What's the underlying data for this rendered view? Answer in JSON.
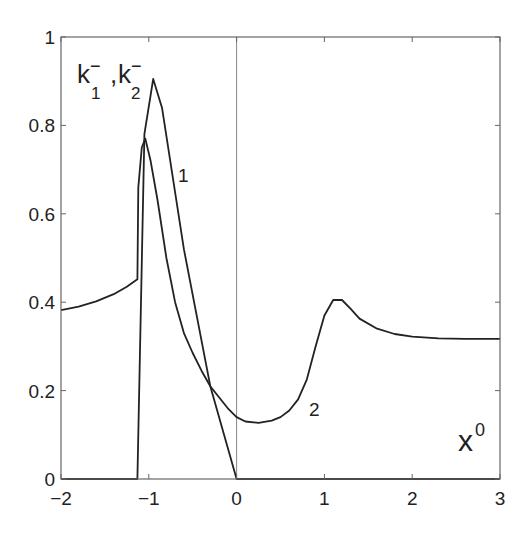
{
  "chart_data": {
    "type": "line",
    "title": "",
    "xlabel": "x^0",
    "ylabel": "k1-, k2-",
    "xlim": [
      -2,
      3
    ],
    "ylim": [
      0,
      1
    ],
    "xticks": [
      -2,
      -1,
      0,
      1,
      2,
      3
    ],
    "yticks": [
      0,
      0.2,
      0.4,
      0.6,
      0.8,
      1
    ],
    "xtick_labels": [
      "−2",
      "−1",
      "0",
      "1",
      "2",
      "3"
    ],
    "ytick_labels": [
      "0",
      "0.2",
      "0.4",
      "0.6",
      "0.8",
      "1"
    ],
    "grid": false,
    "legend": "none (inline curve labels)",
    "reference_lines": [
      {
        "orientation": "vertical",
        "x": 0
      }
    ],
    "series": [
      {
        "name": "1",
        "x": [
          -2,
          -1.13,
          -1.13,
          -1.05,
          -0.95,
          -0.85,
          -0.6,
          -0.3,
          0,
          0.0001,
          3
        ],
        "y": [
          0,
          0,
          0,
          0.78,
          0.905,
          0.84,
          0.52,
          0.21,
          0,
          0,
          0
        ]
      },
      {
        "name": "2",
        "x": [
          -2,
          -1.8,
          -1.6,
          -1.4,
          -1.25,
          -1.13,
          -1.12,
          -1.08,
          -1.04,
          -0.98,
          -0.9,
          -0.8,
          -0.7,
          -0.6,
          -0.5,
          -0.4,
          -0.3,
          -0.2,
          -0.1,
          0,
          0.1,
          0.25,
          0.4,
          0.5,
          0.6,
          0.7,
          0.8,
          0.9,
          1.0,
          1.1,
          1.2,
          1.3,
          1.4,
          1.6,
          1.8,
          2.0,
          2.3,
          2.6,
          3.0
        ],
        "y": [
          0.382,
          0.39,
          0.402,
          0.418,
          0.435,
          0.452,
          0.66,
          0.75,
          0.77,
          0.72,
          0.63,
          0.5,
          0.4,
          0.33,
          0.285,
          0.245,
          0.21,
          0.185,
          0.16,
          0.14,
          0.13,
          0.127,
          0.132,
          0.14,
          0.155,
          0.18,
          0.225,
          0.3,
          0.37,
          0.405,
          0.405,
          0.385,
          0.363,
          0.34,
          0.328,
          0.322,
          0.318,
          0.317,
          0.317
        ]
      }
    ],
    "annotations": [
      {
        "text": "1",
        "x": -0.8,
        "y": 0.73
      },
      {
        "text": "2",
        "x": 0.75,
        "y": 0.15
      },
      {
        "text": "x^0",
        "x": 2.6,
        "y": 0.07
      },
      {
        "text": "k1-, k2-",
        "x": -1.75,
        "y": 0.88
      }
    ]
  },
  "labels": {
    "curve1": "1",
    "curve2": "2",
    "xlabel_base": "x",
    "xlabel_sup": "0",
    "ylabel_k": "k",
    "ylabel_sub1": "1",
    "ylabel_sub2": "2",
    "ylabel_sup": "−",
    "ylabel_comma": ","
  }
}
